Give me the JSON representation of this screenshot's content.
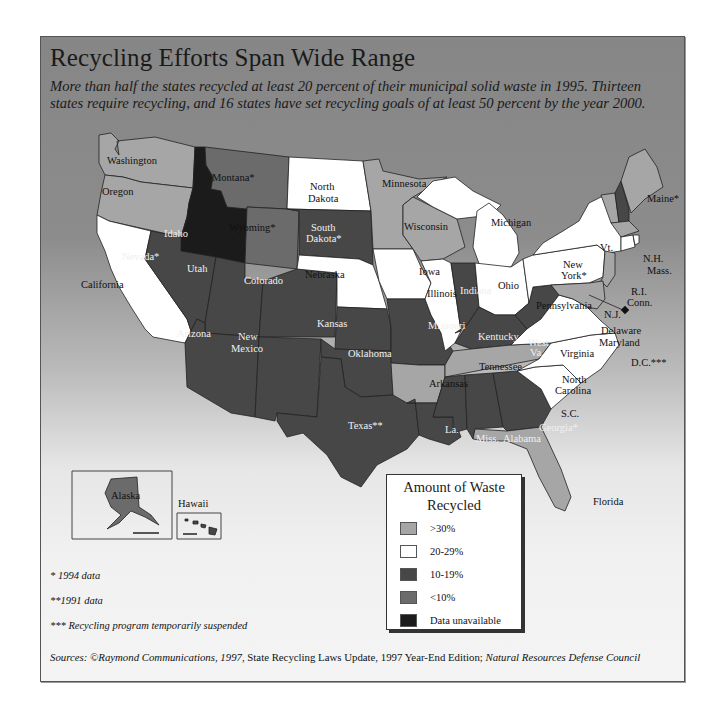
{
  "header": {
    "title": "Recycling Efforts Span Wide Range",
    "subtitle": "More than half the states recycled at least 20 percent of their municipal solid waste in 1995. Thirteen states require recycling, and 16 states have set recycling goals of at least 50 percent by the year 2000."
  },
  "colors": {
    "over30": "#a6a6a6",
    "r20to29": "#ffffff",
    "r10to19": "#474747",
    "under10": "#6b6b6b",
    "unavailable": "#1b1b1b",
    "border": "#222222"
  },
  "legend": {
    "title_line1": "Amount of Waste",
    "title_line2": "Recycled",
    "items": [
      {
        "label": ">30%",
        "color": "#a6a6a6"
      },
      {
        "label": "20-29%",
        "color": "#ffffff"
      },
      {
        "label": "10-19%",
        "color": "#474747"
      },
      {
        "label": "<10%",
        "color": "#6b6b6b"
      },
      {
        "label": "Data unavailable",
        "color": "#1b1b1b"
      }
    ]
  },
  "states": {
    "washington": {
      "label": "Washington",
      "category": ">30%"
    },
    "oregon": {
      "label": "Oregon",
      "category": ">30%"
    },
    "california": {
      "label": "California",
      "category": "20-29%"
    },
    "idaho": {
      "label": "Idaho",
      "category": "Data unavailable"
    },
    "nevada": {
      "label": "Nevada*",
      "category": "10-19%"
    },
    "montana": {
      "label": "Montana*",
      "category": "<10%"
    },
    "wyoming": {
      "label": "Wyoming*",
      "category": "<10%"
    },
    "utah": {
      "label": "Utah",
      "category": "10-19%"
    },
    "colorado": {
      "label": "Colorado",
      "category": "10-19%"
    },
    "arizona": {
      "label": "Arizona",
      "category": "10-19%"
    },
    "new_mexico_1": {
      "label": "New",
      "category": "10-19%"
    },
    "new_mexico_2": {
      "label": "Mexico",
      "category": "10-19%"
    },
    "north_dakota_1": {
      "label": "North",
      "category": "20-29%"
    },
    "north_dakota_2": {
      "label": "Dakota",
      "category": "20-29%"
    },
    "south_dakota_1": {
      "label": "South",
      "category": "10-19%"
    },
    "south_dakota_2": {
      "label": "Dakota*",
      "category": "10-19%"
    },
    "nebraska": {
      "label": "Nebraska",
      "category": "20-29%"
    },
    "kansas": {
      "label": "Kansas",
      "category": "10-19%"
    },
    "oklahoma": {
      "label": "Oklahoma",
      "category": "10-19%"
    },
    "texas": {
      "label": "Texas**",
      "category": "10-19%"
    },
    "minnesota": {
      "label": "Minnesota",
      "category": ">30%"
    },
    "iowa": {
      "label": "Iowa",
      "category": "20-29%"
    },
    "missouri": {
      "label": "Missouri",
      "category": "10-19%"
    },
    "arkansas": {
      "label": "Arkansas",
      "category": ">30%"
    },
    "louisiana": {
      "label": "La.",
      "category": "10-19%"
    },
    "wisconsin": {
      "label": "Wisconsin",
      "category": ">30%"
    },
    "illinois": {
      "label": "Illinois",
      "category": "20-29%"
    },
    "michigan": {
      "label": "Michigan",
      "category": "20-29%"
    },
    "indiana": {
      "label": "Indiana",
      "category": "10-19%"
    },
    "ohio": {
      "label": "Ohio",
      "category": "20-29%"
    },
    "kentucky": {
      "label": "Kentucky",
      "category": "10-19%"
    },
    "tennessee": {
      "label": "Tennessee",
      "category": ">30%"
    },
    "mississippi": {
      "label": "Miss.",
      "category": "10-19%"
    },
    "alabama": {
      "label": "Alabama",
      "category": "10-19%"
    },
    "georgia": {
      "label": "Georgia*",
      "category": "10-19%"
    },
    "florida": {
      "label": "Florida",
      "category": ">30%"
    },
    "south_carolina": {
      "label": "S.C.",
      "category": "20-29%"
    },
    "north_carolina_1": {
      "label": "North",
      "category": "20-29%"
    },
    "north_carolina_2": {
      "label": "Carolina",
      "category": "20-29%"
    },
    "virginia": {
      "label": "Virginia",
      "category": "20-29%"
    },
    "west_virginia_1": {
      "label": "West",
      "category": "10-19%"
    },
    "west_virginia_2": {
      "label": "Va.",
      "category": "10-19%"
    },
    "pennsylvania": {
      "label": "Pennsylvania",
      "category": "20-29%"
    },
    "new_york_1": {
      "label": "New",
      "category": "20-29%"
    },
    "new_york_2": {
      "label": "York*",
      "category": "20-29%"
    },
    "vermont": {
      "label": "Vt.",
      "category": ">30%"
    },
    "new_hampshire": {
      "label": "N.H.",
      "category": "10-19%"
    },
    "maine": {
      "label": "Maine*",
      "category": ">30%"
    },
    "massachusetts": {
      "label": "Mass.",
      "category": ">30%"
    },
    "rhode_island": {
      "label": "R.I.",
      "category": "20-29%"
    },
    "connecticut": {
      "label": "Conn.",
      "category": "20-29%"
    },
    "new_jersey": {
      "label": "N.J.",
      "category": ">30%"
    },
    "delaware": {
      "label": "Delaware",
      "category": ">30%"
    },
    "maryland": {
      "label": "Maryland",
      "category": ">30%"
    },
    "dc": {
      "label": "D.C.***",
      "category": "10-19%"
    },
    "alaska": {
      "label": "Alaska",
      "category": "<10%"
    },
    "hawaii": {
      "label": "Hawaii",
      "category": "10-19%"
    }
  },
  "footnotes": {
    "note1": "* 1994 data",
    "note2": "**1991 data",
    "note3": "*** Recycling program temporarily suspended"
  },
  "sources": {
    "prefix": "Sources: ©Raymond Communications, 1997,",
    "report": " State Recycling Laws Update, 1997 Year-End Edition;",
    "org": " Natural Resources Defense Council"
  }
}
